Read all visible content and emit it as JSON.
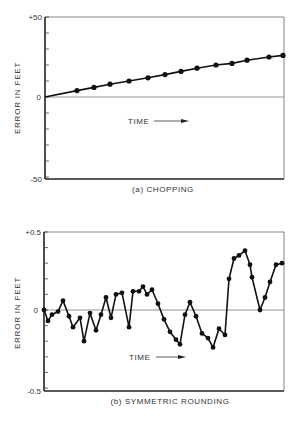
{
  "chart_data": [
    {
      "type": "line",
      "panel": "a",
      "title": "(a) CHOPPING",
      "xlabel": "TIME",
      "ylabel": "ERROR IN FEET",
      "ylim": [
        -50,
        50
      ],
      "y_ticks": [
        "+50",
        "0",
        "-50"
      ],
      "minor_tick_step": 10,
      "grid": false,
      "zero_line": true,
      "markers": true,
      "x": [
        0,
        1,
        2,
        3,
        4,
        5,
        6,
        7,
        8,
        9,
        10,
        11,
        12,
        13
      ],
      "values": [
        0,
        4,
        6,
        8,
        10,
        12,
        14,
        16,
        18,
        20,
        21,
        23,
        25,
        26
      ],
      "marker_on_first": false
    },
    {
      "type": "line",
      "panel": "b",
      "title": "(b) SYMMETRIC ROUNDING",
      "xlabel": "TIME",
      "ylabel": "ERROR IN FEET",
      "ylim": [
        -0.5,
        0.5
      ],
      "y_ticks": [
        "+0.5",
        "0",
        "-0.5"
      ],
      "minor_tick_step": 0.1,
      "grid": false,
      "zero_line": true,
      "markers": true,
      "values": [
        0.0,
        -0.07,
        -0.03,
        -0.01,
        0.06,
        -0.04,
        -0.11,
        -0.05,
        -0.2,
        -0.02,
        -0.13,
        -0.03,
        0.08,
        -0.05,
        0.1,
        0.11,
        -0.11,
        0.12,
        0.12,
        0.15,
        0.1,
        0.13,
        0.04,
        -0.06,
        -0.14,
        -0.19,
        -0.22,
        -0.03,
        0.05,
        -0.04,
        -0.15,
        -0.18,
        -0.24,
        -0.12,
        -0.16,
        0.2,
        0.33,
        0.35,
        0.38,
        0.29,
        0.21,
        0.0,
        0.08,
        0.18,
        0.29,
        0.3
      ],
      "x_px": [
        44,
        48,
        52,
        58,
        63,
        69,
        73,
        80,
        84,
        90,
        96,
        101,
        106,
        111,
        116,
        122,
        129,
        133,
        139,
        143,
        147,
        152,
        158,
        164,
        170,
        176,
        180,
        185,
        190,
        196,
        202,
        208,
        213,
        219,
        225,
        229,
        234,
        239,
        245,
        250,
        252,
        260,
        265,
        270,
        276,
        282
      ]
    }
  ],
  "top_chart": {
    "ylabel": "ERROR IN FEET",
    "tick_top": "+50",
    "tick_zero": "0",
    "tick_bottom": "-50",
    "time_label": "TIME",
    "caption": "(a)  CHOPPING"
  },
  "bottom_chart": {
    "ylabel": "ERROR IN FEET",
    "tick_top": "+0.5",
    "tick_zero": "0",
    "tick_bottom": "-0.5",
    "time_label": "TIME",
    "caption": "(b) SYMMETRIC ROUNDING"
  },
  "colors": {
    "ink": "#1a1a1a",
    "frame": "#555555",
    "zero_line": "#777777",
    "background": "#ffffff"
  }
}
